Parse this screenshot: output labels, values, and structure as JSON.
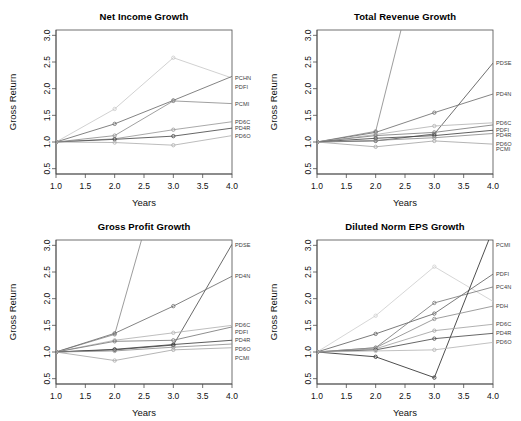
{
  "figure": {
    "panel_count": 4,
    "background": "#ffffff",
    "axis_color": "#4d4d4d"
  },
  "axes": {
    "xlabel": "Years",
    "ylabel": "Gross Return",
    "xticks": [
      "1.0",
      "1.5",
      "2.0",
      "2.5",
      "3.0",
      "3.5",
      "4.0"
    ],
    "yticks": [
      "0.5",
      "1.0",
      "1.5",
      "2.0",
      "2.5",
      "3.0"
    ],
    "xlim": [
      1.0,
      4.0
    ],
    "ylim": [
      0.4,
      3.1
    ]
  },
  "chart_data": [
    {
      "type": "line",
      "title": "Net Income Growth",
      "xlabel": "Years",
      "ylabel": "Gross Return",
      "x": [
        1.0,
        2.0,
        3.0,
        4.0
      ],
      "xlim": [
        1.0,
        4.0
      ],
      "ylim": [
        0.4,
        3.1
      ],
      "grid": false,
      "legend": "right-edge-labels",
      "series": [
        {
          "name": "PCHN",
          "label": "PCHN",
          "values": [
            1.0,
            1.62,
            2.58,
            2.2
          ],
          "color": "#c9c9c9"
        },
        {
          "name": "PDFI",
          "label": "PDFI",
          "values": [
            1.0,
            1.34,
            1.78,
            2.23
          ],
          "color": "#6d6d6d"
        },
        {
          "name": "PCMI",
          "label": "PCMI",
          "values": [
            1.0,
            1.12,
            1.77,
            1.72
          ],
          "color": "#8f8f8f"
        },
        {
          "name": "PD6C",
          "label": "PD6C",
          "values": [
            1.0,
            1.06,
            1.23,
            1.38
          ],
          "color": "#9a9a9a"
        },
        {
          "name": "PD4R",
          "label": "PD4R",
          "values": [
            1.0,
            1.05,
            1.11,
            1.26
          ],
          "color": "#4a4a4a"
        },
        {
          "name": "PD6O",
          "label": "PD6O",
          "values": [
            1.0,
            0.99,
            0.94,
            1.12
          ],
          "color": "#b0b0b0"
        }
      ]
    },
    {
      "type": "line",
      "title": "Total Revenue Growth",
      "xlabel": "Years",
      "ylabel": "Gross Return",
      "x": [
        1.0,
        2.0,
        3.0,
        4.0
      ],
      "xlim": [
        1.0,
        4.0
      ],
      "ylim": [
        0.4,
        3.1
      ],
      "grid": false,
      "legend": "right-edge-labels",
      "series": [
        {
          "name": "PCHN-offscale",
          "label": "",
          "values": [
            1.0,
            1.2,
            5.6,
            9.0
          ],
          "color": "#8a8a8a"
        },
        {
          "name": "PDSE",
          "label": "PDSE",
          "values": [
            1.0,
            1.02,
            1.15,
            2.48
          ],
          "color": "#555555"
        },
        {
          "name": "PD4N",
          "label": "PD4N",
          "values": [
            1.0,
            1.18,
            1.55,
            1.9
          ],
          "color": "#6f6f6f"
        },
        {
          "name": "PD6C",
          "label": "PD6C",
          "values": [
            1.0,
            1.14,
            1.3,
            1.36
          ],
          "color": "#b4b4b4"
        },
        {
          "name": "PDFI",
          "label": "PDFI",
          "values": [
            1.0,
            1.12,
            1.18,
            1.32
          ],
          "color": "#7d7d7d"
        },
        {
          "name": "PD4R",
          "label": "PD4R",
          "values": [
            1.0,
            1.07,
            1.12,
            1.22
          ],
          "color": "#454545"
        },
        {
          "name": "PD6O",
          "label": "PD6O",
          "values": [
            1.0,
            1.03,
            1.08,
            1.16
          ],
          "color": "#8c8c8c"
        },
        {
          "name": "PCMI",
          "label": "PCMI",
          "values": [
            1.0,
            0.91,
            1.02,
            0.96
          ],
          "color": "#a6a6a6"
        }
      ]
    },
    {
      "type": "line",
      "title": "Gross Profit Growth",
      "xlabel": "Years",
      "ylabel": "Gross Return",
      "x": [
        1.0,
        2.0,
        3.0,
        4.0
      ],
      "xlim": [
        1.0,
        4.0
      ],
      "ylim": [
        0.4,
        3.1
      ],
      "grid": false,
      "legend": "right-edge-labels",
      "series": [
        {
          "name": "PCHN-offscale",
          "label": "",
          "values": [
            1.0,
            1.33,
            5.2,
            8.4
          ],
          "color": "#8a8a8a"
        },
        {
          "name": "PDSE",
          "label": "PDSE",
          "values": [
            1.0,
            1.04,
            1.13,
            3.02
          ],
          "color": "#4f4f4f"
        },
        {
          "name": "PD4N",
          "label": "PD4N",
          "values": [
            1.0,
            1.35,
            1.86,
            2.42
          ],
          "color": "#6d6d6d"
        },
        {
          "name": "PD6C",
          "label": "PD6C",
          "values": [
            1.0,
            1.22,
            1.36,
            1.5
          ],
          "color": "#b2b2b2"
        },
        {
          "name": "PDFI",
          "label": "PDFI",
          "values": [
            1.0,
            1.2,
            1.22,
            1.47
          ],
          "color": "#7a7a7a"
        },
        {
          "name": "PD4R",
          "label": "PD4R",
          "values": [
            1.0,
            1.05,
            1.14,
            1.22
          ],
          "color": "#3f3f3f"
        },
        {
          "name": "PD6O",
          "label": "PD6O",
          "values": [
            1.0,
            1.02,
            1.09,
            1.15
          ],
          "color": "#909090"
        },
        {
          "name": "PCMI",
          "label": "PCMI",
          "values": [
            1.0,
            0.84,
            1.04,
            1.08
          ],
          "color": "#a8a8a8"
        }
      ]
    },
    {
      "type": "line",
      "title": "Diluted Norm EPS Growth",
      "xlabel": "Years",
      "ylabel": "Gross Return",
      "x": [
        1.0,
        2.0,
        3.0,
        4.0
      ],
      "xlim": [
        1.0,
        4.0
      ],
      "ylim": [
        0.4,
        3.1
      ],
      "grid": false,
      "legend": "right-edge-labels",
      "series": [
        {
          "name": "PCHN-peak",
          "label": "",
          "values": [
            1.0,
            1.68,
            2.6,
            1.95
          ],
          "color": "#cfcfcf"
        },
        {
          "name": "PDFI",
          "label": "PDFI",
          "values": [
            1.0,
            1.34,
            1.72,
            2.46
          ],
          "color": "#636363"
        },
        {
          "name": "PC4N",
          "label": "PC4N",
          "values": [
            1.0,
            1.08,
            1.92,
            2.22
          ],
          "color": "#7b7b7b"
        },
        {
          "name": "PCMI",
          "label": "PCMI",
          "values": [
            1.0,
            0.91,
            0.52,
            3.3
          ],
          "color": "#2e2e2e"
        },
        {
          "name": "PDH",
          "label": "PDH",
          "values": [
            1.0,
            1.08,
            1.62,
            1.86
          ],
          "color": "#8d8d8d"
        },
        {
          "name": "PD6C",
          "label": "PD6C",
          "values": [
            1.0,
            1.06,
            1.4,
            1.52
          ],
          "color": "#a3a3a3"
        },
        {
          "name": "PD4R",
          "label": "PD4R",
          "values": [
            1.0,
            1.04,
            1.25,
            1.35
          ],
          "color": "#4c4c4c"
        },
        {
          "name": "PD6O",
          "label": "PD6O",
          "values": [
            1.0,
            1.02,
            1.04,
            1.18
          ],
          "color": "#b6b6b6"
        }
      ]
    }
  ]
}
